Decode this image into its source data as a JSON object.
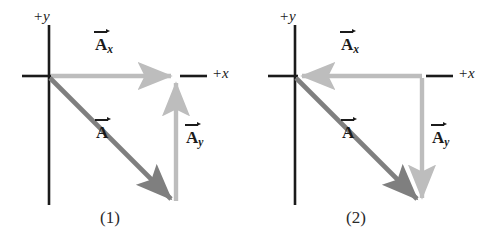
{
  "figure": {
    "colors": {
      "axis": "#1b1b1b",
      "resultant": "#7f7f7f",
      "component": "#bdbdbd",
      "text": "#1b1b1b",
      "background": "#ffffff"
    },
    "axis_labels": {
      "x": "+x",
      "y": "+y"
    },
    "vector_labels": {
      "resultant": "A",
      "x_component": "A",
      "y_component": "A",
      "x_subscript": "x",
      "y_subscript": "y"
    },
    "panels": [
      {
        "caption": "(1)",
        "origin": {
          "x": 49,
          "y": 76
        },
        "corner": {
          "x": 176,
          "y": 76
        },
        "tip": {
          "x": 176,
          "y": 203
        },
        "y_axis": {
          "top": 25,
          "bottom": 205
        },
        "x_axis_left_end": 22,
        "x_axis_right_end": 207,
        "x_component": {
          "direction": "right",
          "from": "origin",
          "to": "corner",
          "arrowhead_at": "corner"
        },
        "y_component": {
          "direction": "up",
          "from": "tip",
          "to": "corner",
          "arrowhead_at": "corner"
        },
        "resultant": {
          "direction": "down-right",
          "from": "origin",
          "to": "tip",
          "arrowhead_at": "tip"
        },
        "label_positions": {
          "axis_y": {
            "left": 33,
            "top": 9
          },
          "axis_x": {
            "left": 212,
            "top": 66
          },
          "x_component": {
            "left": 95,
            "top": 36
          },
          "resultant": {
            "left": 96,
            "top": 124
          },
          "y_component": {
            "left": 186,
            "top": 129
          },
          "caption": {
            "left": 100,
            "top": 208
          }
        }
      },
      {
        "caption": "(2)",
        "origin": {
          "x": 49,
          "y": 76
        },
        "corner": {
          "x": 176,
          "y": 76
        },
        "tip": {
          "x": 176,
          "y": 203
        },
        "y_axis": {
          "top": 25,
          "bottom": 205
        },
        "x_axis_left_end": 22,
        "x_axis_right_end": 207,
        "x_component": {
          "direction": "left",
          "from": "corner",
          "to": "origin",
          "arrowhead_at": "origin"
        },
        "y_component": {
          "direction": "down",
          "from": "corner",
          "to": "tip",
          "arrowhead_at": "tip"
        },
        "resultant": {
          "direction": "down-right",
          "from": "origin",
          "to": "tip",
          "arrowhead_at": "tip"
        },
        "label_positions": {
          "axis_y": {
            "left": 33,
            "top": 9
          },
          "axis_x": {
            "left": 212,
            "top": 66
          },
          "x_component": {
            "left": 95,
            "top": 36
          },
          "resultant": {
            "left": 96,
            "top": 124
          },
          "y_component": {
            "left": 186,
            "top": 129
          },
          "caption": {
            "left": 100,
            "top": 208
          }
        }
      }
    ]
  }
}
